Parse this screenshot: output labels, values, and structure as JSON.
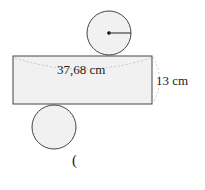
{
  "figure": {
    "width_label": "37,68 cm",
    "height_label": "13 cm",
    "answer_paren": "("
  },
  "colors": {
    "fill": "#f1f1f1",
    "stroke": "#444444",
    "dashed": "#bbbbbb"
  }
}
